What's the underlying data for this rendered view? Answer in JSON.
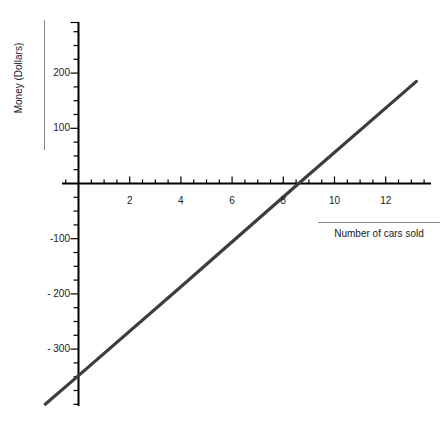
{
  "chart_data": {
    "type": "line",
    "title": "",
    "xlabel": "Number of cars sold",
    "ylabel": "Money (Dollars)",
    "xlim": [
      -1.35,
      14.5
    ],
    "ylim": [
      -400,
      293
    ],
    "grid": false,
    "legend": null,
    "x_ticks_major": [
      2,
      4,
      6,
      8,
      10,
      12
    ],
    "x_tick_labels": [
      "2",
      "4",
      "6",
      "8",
      "10",
      "12"
    ],
    "x_tick_minor_step": 0.5,
    "y_ticks_major": [
      200,
      100,
      -100,
      -200,
      -300
    ],
    "y_tick_labels": [
      "200",
      "100",
      "-100",
      "- 200",
      "- 300"
    ],
    "y_tick_minor_step": 25,
    "series": [
      {
        "name": "profit-line",
        "color": "#3d3d3d",
        "x": [
          -1.3,
          13.2
        ],
        "values": [
          -400,
          185
        ],
        "slope": 40.3,
        "intercept": -347.6,
        "x_intercept": 8.6,
        "points": [
          {
            "x": -1.3,
            "y": -400
          },
          {
            "x": 0,
            "y": -348
          },
          {
            "x": 4,
            "y": -187
          },
          {
            "x": 8.6,
            "y": 0
          },
          {
            "x": 13.2,
            "y": 185
          }
        ]
      }
    ]
  },
  "axis": {
    "y_title": "Money (Dollars)",
    "x_title": "Number of cars sold"
  },
  "colors": {
    "line": "#3d3d3d",
    "axis": "#000000",
    "text": "#1a1a1a",
    "rule": "#8a8a8a",
    "background": "#ffffff"
  }
}
